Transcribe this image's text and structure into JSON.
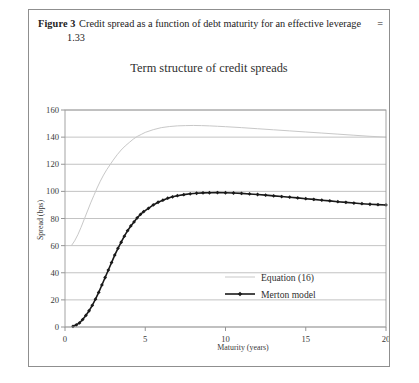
{
  "figure": {
    "label": "Figure 3",
    "caption_line1": "Credit spread as a function of debt maturity for an effective leverage",
    "caption_equals": "=",
    "caption_line2": "1.33"
  },
  "chart_data": {
    "type": "line",
    "title": "Term structure of credit spreads",
    "xlabel": "Maturity (years)",
    "ylabel": "Spread (bps)",
    "xlim": [
      0,
      20
    ],
    "ylim": [
      0,
      160
    ],
    "xticks": [
      0,
      5,
      10,
      15,
      20
    ],
    "yticks": [
      0,
      20,
      40,
      60,
      80,
      100,
      120,
      140,
      160
    ],
    "grid": true,
    "legend_position": "inside-lower-right",
    "series": [
      {
        "name": "Equation (16)",
        "color": "#c8c8c8",
        "marker": "none",
        "linewidth": 1.0,
        "x": [
          0.4,
          0.6,
          0.8,
          1.0,
          1.2,
          1.4,
          1.6,
          1.8,
          2.0,
          2.2,
          2.4,
          2.6,
          2.8,
          3.0,
          3.25,
          3.5,
          3.75,
          4.0,
          4.25,
          4.5,
          4.75,
          5.0,
          5.5,
          6.0,
          6.5,
          7.0,
          7.5,
          8.0,
          8.5,
          9.0,
          9.5,
          10.0,
          11.0,
          12.0,
          13.0,
          14.0,
          15.0,
          16.0,
          17.0,
          18.0,
          19.0,
          20.0
        ],
        "y": [
          60.0,
          63.5,
          68.0,
          73.5,
          79.5,
          85.5,
          91.5,
          97.0,
          102.5,
          107.5,
          112.0,
          116.0,
          119.5,
          123.0,
          127.0,
          130.5,
          133.5,
          136.0,
          138.5,
          140.5,
          142.0,
          143.5,
          145.5,
          147.0,
          147.8,
          148.3,
          148.5,
          148.6,
          148.5,
          148.3,
          148.0,
          147.7,
          147.0,
          146.2,
          145.4,
          144.6,
          143.8,
          143.0,
          142.2,
          141.4,
          140.6,
          140.0
        ]
      },
      {
        "name": "Merton model",
        "color": "#1a1a1a",
        "marker": "diamond",
        "linewidth": 1.6,
        "x": [
          0.5,
          0.7,
          0.9,
          1.1,
          1.3,
          1.5,
          1.7,
          1.9,
          2.1,
          2.3,
          2.5,
          2.7,
          2.9,
          3.1,
          3.3,
          3.5,
          3.7,
          3.9,
          4.1,
          4.3,
          4.5,
          4.7,
          4.9,
          5.2,
          5.5,
          5.8,
          6.1,
          6.4,
          6.7,
          7.0,
          7.4,
          7.8,
          8.2,
          8.6,
          9.0,
          9.5,
          10.0,
          10.5,
          11.0,
          11.5,
          12.0,
          12.5,
          13.0,
          13.5,
          14.0,
          14.5,
          15.0,
          15.5,
          16.0,
          16.5,
          17.0,
          17.5,
          18.0,
          18.5,
          19.0,
          19.5,
          20.0
        ],
        "y": [
          0.5,
          1.5,
          3.0,
          5.5,
          8.5,
          12.0,
          16.0,
          20.5,
          25.5,
          31.0,
          36.5,
          42.0,
          47.5,
          53.0,
          58.0,
          62.5,
          67.0,
          71.0,
          74.5,
          77.5,
          80.5,
          83.0,
          85.0,
          87.5,
          90.0,
          92.0,
          93.5,
          95.0,
          96.0,
          96.8,
          97.6,
          98.2,
          98.6,
          98.9,
          99.0,
          99.1,
          99.0,
          98.8,
          98.5,
          98.1,
          97.7,
          97.2,
          96.7,
          96.2,
          95.7,
          95.2,
          94.6,
          94.1,
          93.5,
          93.0,
          92.4,
          91.9,
          91.4,
          90.9,
          90.5,
          90.2,
          90.0
        ]
      }
    ]
  }
}
